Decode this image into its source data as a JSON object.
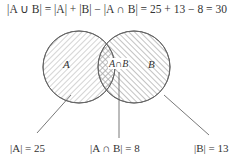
{
  "formula": "|A ∪ B| = |A| + |B| − |A ∩ B| = 25 + 13 − 8 = 30",
  "regions": {
    "a_label": "A",
    "b_label": "B",
    "intersection_label": "A∩B"
  },
  "callouts": {
    "a": "|A| = 25",
    "intersection": "|A ∩ B| = 8",
    "b": "|B| = 13"
  },
  "values": {
    "A": 25,
    "B": 13,
    "A_and_B": 8,
    "A_or_B": 30
  },
  "colors": {
    "stroke": "#555555",
    "hatch": "#999999"
  }
}
